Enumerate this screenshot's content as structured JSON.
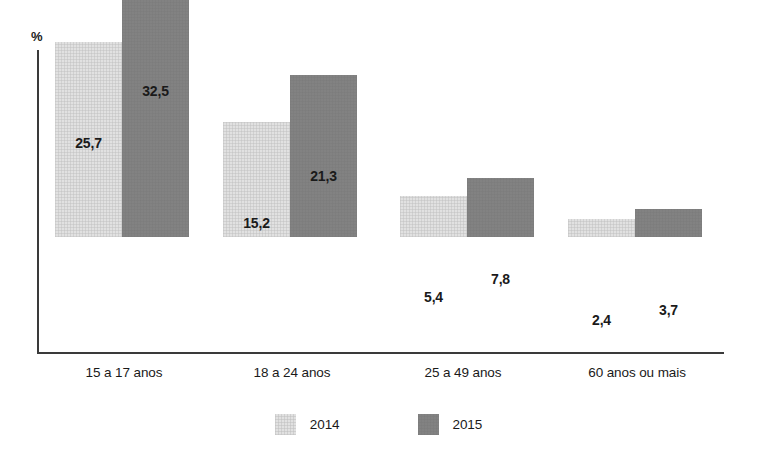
{
  "chart_data": {
    "type": "bar",
    "title": "",
    "subtitle": "",
    "xlabel": "",
    "ylabel": "%",
    "ylim": [
      0,
      40
    ],
    "grid": false,
    "legend_position": "bottom-center",
    "categories": [
      "15 a 17 anos",
      "18 a 24  anos",
      "25 a 49  anos",
      "60 anos ou mais"
    ],
    "series": [
      {
        "name": "2014",
        "color": "#e1e1e1",
        "values": [
          25.7,
          15.2,
          5.4,
          2.4
        ],
        "labels": [
          "25,7",
          "15,2",
          "5,4",
          "2,4"
        ]
      },
      {
        "name": "2015",
        "color": "#828282",
        "values": [
          32.5,
          21.3,
          7.8,
          3.7
        ],
        "labels": [
          "32,5",
          "21,3",
          "7,8",
          "3,7"
        ]
      }
    ],
    "annotations": []
  },
  "axes": {
    "unit_label": "%",
    "axis_color": "#3a3a3a"
  },
  "legend": {
    "items": [
      {
        "label": "2014",
        "color": "#e1e1e1"
      },
      {
        "label": "2015",
        "color": "#828282"
      }
    ]
  }
}
